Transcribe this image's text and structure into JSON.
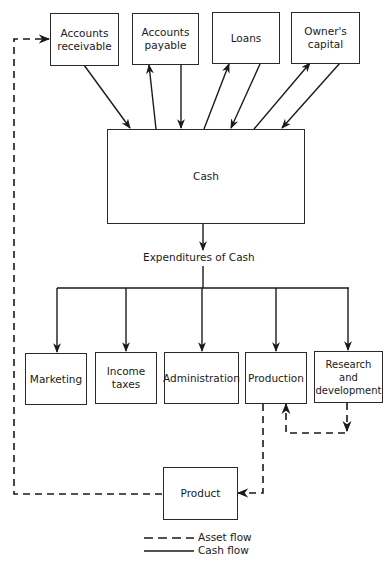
{
  "diagram": {
    "type": "flowchart",
    "nodes": {
      "accounts_receivable": "Accounts\nreceivable",
      "accounts_payable": "Accounts\npayable",
      "loans": "Loans",
      "owners_capital": "Owner's\ncapital",
      "cash": "Cash",
      "marketing": "Marketing",
      "income_taxes": "Income\ntaxes",
      "administration": "Administration",
      "production": "Production",
      "research_development": "Research and\ndevelopment",
      "product": "Product"
    },
    "expenditures_label": "Expenditures of Cash",
    "legend": {
      "asset_flow": "Asset flow",
      "cash_flow": "Cash flow"
    },
    "edges": [
      {
        "from": "accounts_receivable",
        "to": "cash",
        "style": "solid"
      },
      {
        "from": "cash",
        "to": "accounts_payable",
        "style": "solid"
      },
      {
        "from": "accounts_payable",
        "to": "cash",
        "style": "solid"
      },
      {
        "from": "cash",
        "to": "loans",
        "style": "solid"
      },
      {
        "from": "loans",
        "to": "cash",
        "style": "solid"
      },
      {
        "from": "cash",
        "to": "owners_capital",
        "style": "solid"
      },
      {
        "from": "owners_capital",
        "to": "cash",
        "style": "solid"
      },
      {
        "from": "cash",
        "to": "expenditures",
        "style": "solid"
      },
      {
        "from": "expenditures",
        "to": "marketing",
        "style": "solid"
      },
      {
        "from": "expenditures",
        "to": "income_taxes",
        "style": "solid"
      },
      {
        "from": "expenditures",
        "to": "administration",
        "style": "solid"
      },
      {
        "from": "expenditures",
        "to": "production",
        "style": "solid"
      },
      {
        "from": "expenditures",
        "to": "research_development",
        "style": "solid"
      },
      {
        "from": "research_development",
        "to": "production",
        "style": "dashed"
      },
      {
        "from": "production",
        "to": "product",
        "style": "dashed"
      },
      {
        "from": "product",
        "to": "accounts_receivable",
        "style": "dashed"
      }
    ]
  }
}
